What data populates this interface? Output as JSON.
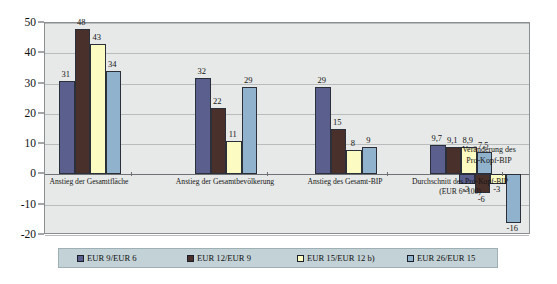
{
  "chart_data": {
    "type": "bar",
    "title": "",
    "subtitle": "",
    "xlabel": "",
    "ylabel": "",
    "ylim": [
      -20,
      50
    ],
    "yticks": [
      50,
      40,
      30,
      20,
      10,
      0,
      -10,
      -20
    ],
    "ytick_labels": [
      "50",
      "40",
      "30",
      "20",
      "10",
      "0",
      "-10",
      "-20"
    ],
    "grid": true,
    "legend_position": "bottom",
    "categories": [
      "Anstieg der Gesamtfläche",
      "Anstieg der Gesamtbevölkerung",
      "Anstieg des Gesamt-BIP",
      "Durchschnitt des Pro-Kopf-BIP\n(EUR 6=100)",
      "Veränderung des\nPro-Kopf-BIP"
    ],
    "category_lines": [
      [
        "Anstieg der Gesamtfläche"
      ],
      [
        "Anstieg der Gesamtbevölkerung"
      ],
      [
        "Anstieg des Gesamt-BIP"
      ],
      [
        "Durchschnitt des Pro-Kopf-BIP",
        "(EUR 6=100)"
      ],
      []
    ],
    "series": [
      {
        "name": "EUR  9/EUR 6",
        "color": "#5b5f8e",
        "values": [
          31,
          32,
          29,
          9.7,
          -3
        ],
        "labels": [
          "31",
          "32",
          "29",
          "9,7",
          "-3"
        ]
      },
      {
        "name": "EUR 12/EUR 9",
        "color": "#4a302a",
        "values": [
          48,
          22,
          15,
          9.1,
          -6
        ],
        "labels": [
          "48",
          "22",
          "15",
          "9,1",
          "-6"
        ]
      },
      {
        "name": "EUR 15/EUR 12 b)",
        "color": "#fbfbc2",
        "values": [
          43,
          11,
          8,
          8.9,
          -3
        ],
        "labels": [
          "43",
          "11",
          "8",
          "8,9",
          "-3"
        ]
      },
      {
        "name": "EUR 26/EUR 15",
        "color": "#91b2cd",
        "values": [
          34,
          29,
          9,
          7.5,
          -16
        ],
        "labels": [
          "34",
          "29",
          "9",
          "7,5",
          "-16"
        ]
      }
    ],
    "annotations": [
      {
        "text_lines": [
          "Veränderung des",
          "Pro-Kopf-BIP"
        ],
        "group_index": 4
      }
    ],
    "colors": {
      "plot_background": "#e7e9e8",
      "legend_background": "#c3d2d6",
      "gridline": "#b9bcbd",
      "axis": "#6e7275",
      "text": "#151515"
    }
  }
}
